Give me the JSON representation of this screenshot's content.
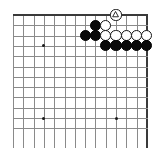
{
  "diagram": {
    "board": {
      "type": "go-board",
      "visible_columns": 14,
      "visible_rows": 12,
      "cell_size": 10.3,
      "origin_x": 13,
      "origin_y": 15,
      "edges": {
        "top": true,
        "right": true,
        "left": false,
        "bottom": false
      },
      "line_color": "#8a8a8a",
      "edge_color": "#3a3a3a",
      "background_color": "#ffffff"
    },
    "hoshi_points": [
      {
        "name": "hoshi-upper-left",
        "col": 3,
        "row": 3
      },
      {
        "name": "hoshi-lower-left",
        "col": 3,
        "row": 10
      },
      {
        "name": "hoshi-lower-right",
        "col": 10,
        "row": 10
      }
    ],
    "stones": [
      {
        "id": "w-triangle-marked",
        "color": "white",
        "col": 10,
        "row": 0,
        "mark": "triangle"
      },
      {
        "id": "b-r1-c8",
        "color": "black",
        "col": 8,
        "row": 1,
        "mark": "none"
      },
      {
        "id": "w-r1-c9",
        "color": "white",
        "col": 9,
        "row": 1,
        "mark": "none"
      },
      {
        "id": "b-r2-c7",
        "color": "black",
        "col": 7,
        "row": 2,
        "mark": "none"
      },
      {
        "id": "b-r2-c8",
        "color": "black",
        "col": 8,
        "row": 2,
        "mark": "none"
      },
      {
        "id": "w-r2-c9",
        "color": "white",
        "col": 9,
        "row": 2,
        "mark": "none"
      },
      {
        "id": "w-r2-c10",
        "color": "white",
        "col": 10,
        "row": 2,
        "mark": "none"
      },
      {
        "id": "w-r2-c11",
        "color": "white",
        "col": 11,
        "row": 2,
        "mark": "none"
      },
      {
        "id": "w-r2-c12",
        "color": "white",
        "col": 12,
        "row": 2,
        "mark": "none"
      },
      {
        "id": "w-r2-c13",
        "color": "white",
        "col": 13,
        "row": 2,
        "mark": "none"
      },
      {
        "id": "b-r3-c9",
        "color": "black",
        "col": 9,
        "row": 3,
        "mark": "none"
      },
      {
        "id": "b-r3-c10",
        "color": "black",
        "col": 10,
        "row": 3,
        "mark": "none"
      },
      {
        "id": "b-r3-c11",
        "color": "black",
        "col": 11,
        "row": 3,
        "mark": "none"
      },
      {
        "id": "b-r3-c12",
        "color": "black",
        "col": 12,
        "row": 3,
        "mark": "none"
      },
      {
        "id": "b-r3-c13",
        "color": "black",
        "col": 13,
        "row": 3,
        "mark": "none"
      }
    ],
    "colors": {
      "black_stone": "#0a0a0a",
      "white_stone": "#ffffff",
      "stone_outline": "#151515",
      "grid": "#8a8a8a",
      "border": "#3a3a3a"
    }
  }
}
